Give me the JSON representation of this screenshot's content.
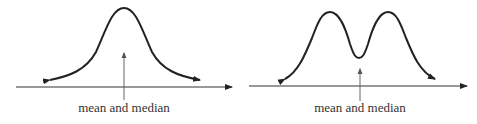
{
  "diagrams": [
    {
      "id": "unimodal",
      "shape": "symmetric unimodal (bell) curve",
      "annotation": "mean and median"
    },
    {
      "id": "bimodal",
      "shape": "symmetric bimodal curve",
      "annotation": "mean and median"
    }
  ],
  "colors": {
    "curve": "#222222",
    "axis": "#333333",
    "pointer": "#555555",
    "text": "#333333"
  }
}
